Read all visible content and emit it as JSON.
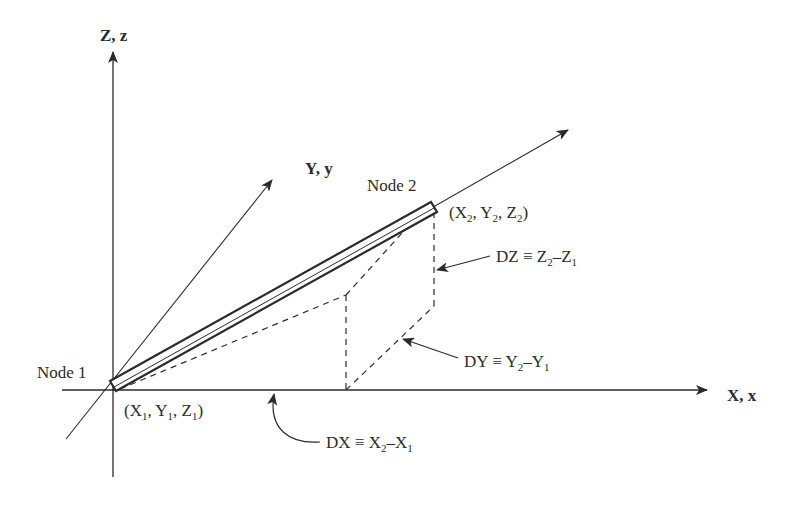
{
  "diagram": {
    "axes": {
      "z_label": "Z, z",
      "y_label": "Y, y",
      "x_label": "X, x"
    },
    "node1": {
      "label": "Node 1",
      "coord_prefix": "(X",
      "coord_sub1": "1",
      "coord_mid1": ", Y",
      "coord_sub2": "1",
      "coord_mid2": ", Z",
      "coord_sub3": "1",
      "coord_suffix": ")"
    },
    "node2": {
      "label": "Node 2",
      "coord_prefix": "(X",
      "coord_sub1": "2",
      "coord_mid1": ", Y",
      "coord_sub2": "2",
      "coord_mid2": ", Z",
      "coord_sub3": "2",
      "coord_suffix": ")"
    },
    "dz": {
      "lhs": "DZ ≡ Z",
      "s1": "2",
      "mid": "–Z",
      "s2": "1"
    },
    "dy": {
      "lhs": "DY ≡ Y",
      "s1": "2",
      "mid": "–Y",
      "s2": "1"
    },
    "dx": {
      "lhs": "DX ≡ X",
      "s1": "2",
      "mid": "–X",
      "s2": "1"
    },
    "colors": {
      "ink": "#2b2b2b",
      "background": "#ffffff"
    }
  }
}
